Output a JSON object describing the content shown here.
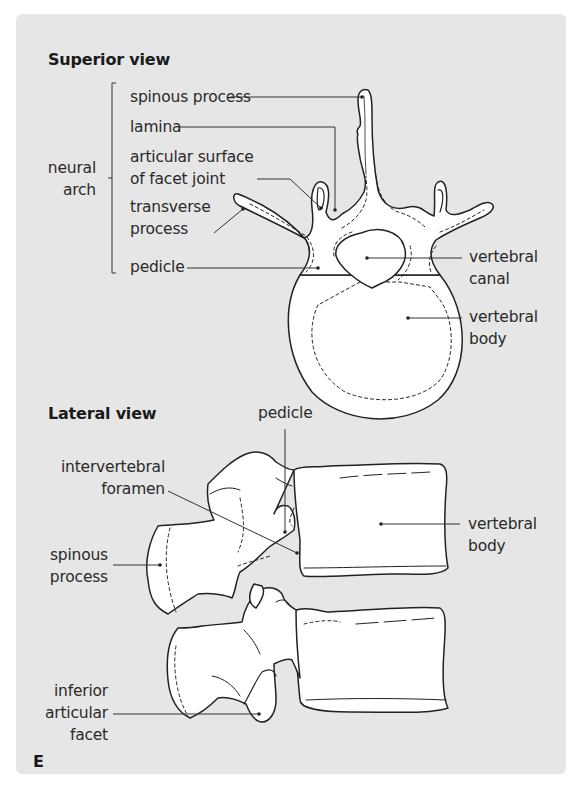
{
  "figure": {
    "panel_letter": "E",
    "background_color": "#e6e6e6",
    "line_color": "#222222",
    "bone_fill": "#ffffff"
  },
  "superior_view": {
    "title": "Superior view",
    "group_label": {
      "line1": "neural",
      "line2": "arch"
    },
    "labels": {
      "spinous_process": "spinous process",
      "lamina": "lamina",
      "articular_surface_line1": "articular surface",
      "articular_surface_line2": "of facet joint",
      "transverse_process_line1": "transverse",
      "transverse_process_line2": "process",
      "pedicle": "pedicle",
      "vertebral_canal_line1": "vertebral",
      "vertebral_canal_line2": "canal",
      "vertebral_body_line1": "vertebral",
      "vertebral_body_line2": "body"
    }
  },
  "lateral_view": {
    "title": "Lateral view",
    "labels": {
      "pedicle": "pedicle",
      "intervertebral_foramen_line1": "intervertebral",
      "intervertebral_foramen_line2": "foramen",
      "spinous_process_line1": "spinous",
      "spinous_process_line2": "process",
      "vertebral_body_line1": "vertebral",
      "vertebral_body_line2": "body",
      "inferior_articular_facet_line1": "inferior",
      "inferior_articular_facet_line2": "articular",
      "inferior_articular_facet_line3": "facet"
    }
  }
}
